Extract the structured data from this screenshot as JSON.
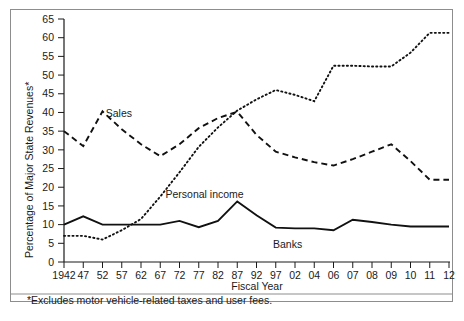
{
  "figure": {
    "footnote": "*Excludes motor vehicle-related taxes and user fees.",
    "frame_color": "#8d8d8d"
  },
  "chart_data": {
    "type": "line",
    "title": "",
    "xlabel": "Fiscal Year",
    "ylabel": "Percentage of Major State Revenues*",
    "categories": [
      "1942",
      "47",
      "52",
      "57",
      "62",
      "67",
      "72",
      "77",
      "82",
      "87",
      "92",
      "97",
      "02",
      "04",
      "06",
      "07",
      "08",
      "09",
      "10",
      "11",
      "12"
    ],
    "ylim": [
      0,
      65
    ],
    "yticks": [
      0,
      5,
      10,
      15,
      20,
      25,
      30,
      35,
      40,
      45,
      50,
      55,
      60,
      65
    ],
    "grid": false,
    "legend_position": "inline-annotations",
    "series": [
      {
        "name": "Sales",
        "style": "dashed",
        "color": "#111111",
        "label_x_category": "57",
        "values": [
          35.0,
          31.0,
          40.3,
          35.5,
          31.5,
          28.3,
          31.5,
          35.8,
          38.5,
          40.2,
          34.0,
          29.5,
          28.0,
          26.7,
          25.8,
          27.5,
          29.5,
          31.5,
          27.0,
          22.0,
          22.0
        ]
      },
      {
        "name": "Personal income",
        "style": "dotted",
        "color": "#111111",
        "label_x_category": "72",
        "values": [
          7.0,
          7.0,
          6.0,
          8.5,
          11.5,
          17.5,
          24.0,
          30.8,
          36.0,
          40.5,
          43.5,
          46.0,
          44.7,
          43.0,
          52.5,
          52.5,
          52.3,
          52.3,
          56.0,
          61.3,
          61.3
        ]
      },
      {
        "name": "Banks",
        "style": "solid",
        "color": "#111111",
        "label_x_category": "02",
        "values": [
          10.0,
          12.2,
          10.0,
          10.0,
          10.0,
          10.0,
          11.0,
          9.3,
          11.0,
          16.2,
          12.5,
          9.2,
          9.0,
          9.0,
          8.5,
          11.3,
          10.7,
          10.0,
          9.5,
          9.5,
          9.5
        ]
      }
    ]
  }
}
